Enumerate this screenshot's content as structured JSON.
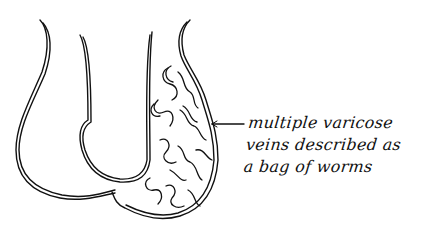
{
  "figure": {
    "line_color": "#111111",
    "background": "#ffffff"
  },
  "annotation": {
    "lines": [
      "multiple varicose",
      "veins described as",
      "a bag of worms"
    ]
  }
}
